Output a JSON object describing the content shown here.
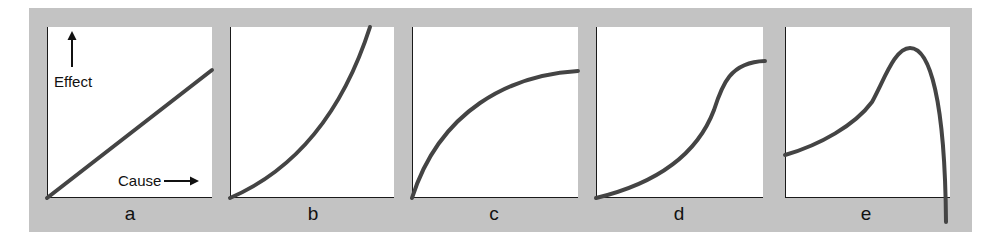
{
  "figure": {
    "frame_color": "#c3c3c3",
    "line_color": "#444444",
    "axis_color": "#1a1a1a",
    "axis_labels": {
      "y": "Effect",
      "x": "Cause"
    },
    "panels": [
      {
        "label": "a",
        "shape": "linear",
        "left": 47,
        "right": 212,
        "label_x": 130,
        "path": "M47,198 L212,70"
      },
      {
        "label": "b",
        "shape": "accelerating",
        "left": 230,
        "right": 394,
        "label_x": 313,
        "path": "M230,198 C290,172 340,120 370,27"
      },
      {
        "label": "c",
        "shape": "saturating",
        "left": 412,
        "right": 578,
        "label_x": 494,
        "path": "M412,198 C440,110 510,75 578,71"
      },
      {
        "label": "d",
        "shape": "sigmoid",
        "left": 596,
        "right": 763,
        "label_x": 679,
        "path": "M596,198 C650,185 695,160 714,110 C722,85 730,62 765,61"
      },
      {
        "label": "e",
        "shape": "rise-then-collapse",
        "left": 785,
        "right": 950,
        "label_x": 866,
        "path": "M785,155 C820,145 855,125 872,102 C885,78 895,48 910,48 C930,48 945,100 946,222"
      }
    ]
  },
  "chart_data": {
    "type": "line",
    "title": "",
    "xlabel": "Cause",
    "ylabel": "Effect",
    "grid": false,
    "panels": [
      {
        "label": "a",
        "description": "linear increase",
        "x": [
          0,
          0.25,
          0.5,
          0.75,
          1.0
        ],
        "y": [
          0,
          0.19,
          0.37,
          0.56,
          0.75
        ]
      },
      {
        "label": "b",
        "description": "accelerating (convex) increase",
        "x": [
          0,
          0.25,
          0.5,
          0.75,
          0.85
        ],
        "y": [
          0,
          0.14,
          0.36,
          0.7,
          1.0
        ]
      },
      {
        "label": "c",
        "description": "diminishing returns / saturating",
        "x": [
          0,
          0.25,
          0.5,
          0.75,
          1.0
        ],
        "y": [
          0,
          0.48,
          0.65,
          0.72,
          0.74
        ]
      },
      {
        "label": "d",
        "description": "sigmoid (S-shaped)",
        "x": [
          0,
          0.25,
          0.5,
          0.7,
          0.85,
          1.0
        ],
        "y": [
          0,
          0.08,
          0.24,
          0.52,
          0.76,
          0.8
        ]
      },
      {
        "label": "e",
        "description": "rises to peak then collapses",
        "x": [
          0,
          0.25,
          0.5,
          0.75,
          0.9,
          0.98
        ],
        "y": [
          0.25,
          0.35,
          0.5,
          0.88,
          0.7,
          -0.14
        ]
      }
    ]
  }
}
